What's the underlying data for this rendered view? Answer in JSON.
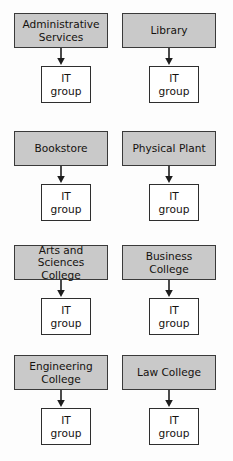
{
  "diagram": {
    "type": "org-chart",
    "background_color": "#fdfdfd",
    "unit_box_fill": "#c9c9c9",
    "unit_box_border": "#3a3a3a",
    "it_box_fill": "#ffffff",
    "it_box_border": "#2e2e2e",
    "arrow_color": "#1d1d1d",
    "child_label": "IT\ngroup",
    "pairs": [
      {
        "id": "administrative-services",
        "unit_label": "Administrative\nServices",
        "child_label": "IT\ngroup",
        "column": "left",
        "row": 1
      },
      {
        "id": "library",
        "unit_label": "Library",
        "child_label": "IT\ngroup",
        "column": "right",
        "row": 1
      },
      {
        "id": "bookstore",
        "unit_label": "Bookstore",
        "child_label": "IT\ngroup",
        "column": "left",
        "row": 2
      },
      {
        "id": "physical-plant",
        "unit_label": "Physical Plant",
        "child_label": "IT\ngroup",
        "column": "right",
        "row": 2
      },
      {
        "id": "arts-and-sciences-college",
        "unit_label": "Arts and\nSciences College",
        "child_label": "IT\ngroup",
        "column": "left",
        "row": 3
      },
      {
        "id": "business-college",
        "unit_label": "Business\nCollege",
        "child_label": "IT\ngroup",
        "column": "right",
        "row": 3
      },
      {
        "id": "engineering-college",
        "unit_label": "Engineering\nCollege",
        "child_label": "IT\ngroup",
        "column": "left",
        "row": 4
      },
      {
        "id": "law-college",
        "unit_label": "Law College",
        "child_label": "IT\ngroup",
        "column": "right",
        "row": 4
      }
    ]
  }
}
